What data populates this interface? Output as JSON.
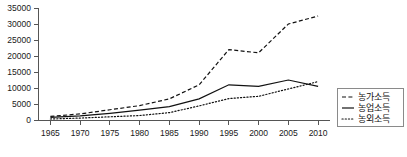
{
  "chart_data": {
    "type": "line",
    "title": "",
    "subtitle": "",
    "xlabel": "",
    "ylabel": "",
    "x": [
      1965,
      1970,
      1975,
      1980,
      1985,
      1990,
      1995,
      2000,
      2005,
      2010
    ],
    "xtick_labels": [
      "1965",
      "1970",
      "1975",
      "1980",
      "1985",
      "1990",
      "1995",
      "2000",
      "2005",
      "2010"
    ],
    "ytick_labels": [
      "0",
      "5000",
      "10000",
      "15000",
      "20000",
      "25000",
      "30000",
      "35000"
    ],
    "ytick_values": [
      0,
      5000,
      10000,
      15000,
      20000,
      25000,
      30000,
      35000
    ],
    "xlim": [
      1963,
      2012
    ],
    "ylim": [
      0,
      35000
    ],
    "grid": false,
    "legend_position": "right",
    "series": [
      {
        "name": "농가소득",
        "style": "dashed",
        "color": "#111111",
        "values": [
          1124,
          1900,
          3200,
          4500,
          6600,
          11000,
          22000,
          21000,
          30000,
          32500
        ]
      },
      {
        "name": "농업소득",
        "style": "solid",
        "color": "#111111",
        "values": [
          800,
          1300,
          2100,
          3100,
          4200,
          6600,
          11000,
          10500,
          12500,
          10500
        ]
      },
      {
        "name": "농외소득",
        "style": "dotted",
        "color": "#111111",
        "values": [
          320,
          600,
          1000,
          1400,
          2300,
          4400,
          6700,
          7400,
          9700,
          12000
        ]
      }
    ]
  },
  "legend": {
    "items": [
      {
        "label": "농가소득",
        "style": "dashed"
      },
      {
        "label": "농업소득",
        "style": "solid"
      },
      {
        "label": "농외소득",
        "style": "dotted"
      }
    ]
  }
}
